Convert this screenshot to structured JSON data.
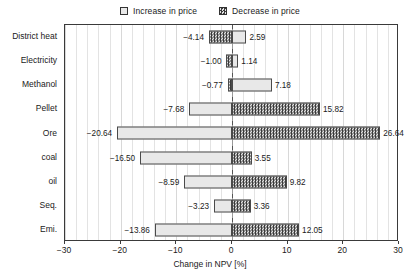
{
  "chart_data": {
    "type": "bar",
    "orientation": "horizontal",
    "subtype": "tornado",
    "title": "",
    "xlabel": "Change in NPV [%]",
    "ylabel": "",
    "xlim": [
      -30,
      30
    ],
    "xticks": [
      -30,
      -20,
      -10,
      0,
      10,
      20,
      30
    ],
    "xticklabels": [
      "-30",
      "-20",
      "-10",
      "0",
      "10",
      "20",
      "30"
    ],
    "minor_grid_step": 2,
    "grid": true,
    "legend_position": "top-center",
    "legend": [
      {
        "label": "Increase in price",
        "pattern": "dotted-light"
      },
      {
        "label": "Decrease in price",
        "pattern": "checkered-dark"
      }
    ],
    "categories": [
      "District heat",
      "Electricity",
      "Methanol",
      "Pellet",
      "Ore",
      "coal",
      "oil",
      "Seq.",
      "Emi."
    ],
    "series": [
      {
        "name": "negative",
        "values": [
          -4.14,
          -1.0,
          -0.77,
          -7.68,
          -20.64,
          -16.5,
          -8.59,
          -3.23,
          -13.86
        ]
      },
      {
        "name": "positive",
        "values": [
          2.59,
          1.14,
          7.18,
          15.82,
          26.64,
          3.55,
          9.82,
          3.36,
          12.05
        ]
      }
    ],
    "rows": [
      {
        "category": "District heat",
        "neg": -4.14,
        "pos": 2.59,
        "neg_label": "-4.14",
        "pos_label": "2.59",
        "neg_pattern": "decrease",
        "pos_pattern": "increase"
      },
      {
        "category": "Electricity",
        "neg": -1.0,
        "pos": 1.14,
        "neg_label": "-1.00",
        "pos_label": "1.14",
        "neg_pattern": "decrease",
        "pos_pattern": "increase"
      },
      {
        "category": "Methanol",
        "neg": -0.77,
        "pos": 7.18,
        "neg_label": "-0.77",
        "pos_label": "7.18",
        "neg_pattern": "decrease",
        "pos_pattern": "increase"
      },
      {
        "category": "Pellet",
        "neg": -7.68,
        "pos": 15.82,
        "neg_label": "-7.68",
        "pos_label": "15.82",
        "neg_pattern": "increase",
        "pos_pattern": "decrease"
      },
      {
        "category": "Ore",
        "neg": -20.64,
        "pos": 26.64,
        "neg_label": "-20.64",
        "pos_label": "26.64",
        "neg_pattern": "increase",
        "pos_pattern": "decrease"
      },
      {
        "category": "coal",
        "neg": -16.5,
        "pos": 3.55,
        "neg_label": "-16.50",
        "pos_label": "3.55",
        "neg_pattern": "increase",
        "pos_pattern": "decrease"
      },
      {
        "category": "oil",
        "neg": -8.59,
        "pos": 9.82,
        "neg_label": "-8.59",
        "pos_label": "9.82",
        "neg_pattern": "increase",
        "pos_pattern": "decrease"
      },
      {
        "category": "Seq.",
        "neg": -3.23,
        "pos": 3.36,
        "neg_label": "-3.23",
        "pos_label": "3.36",
        "neg_pattern": "increase",
        "pos_pattern": "decrease"
      },
      {
        "category": "Emi.",
        "neg": -13.86,
        "pos": 12.05,
        "neg_label": "-13.86",
        "pos_label": "12.05",
        "neg_pattern": "increase",
        "pos_pattern": "decrease"
      }
    ]
  }
}
